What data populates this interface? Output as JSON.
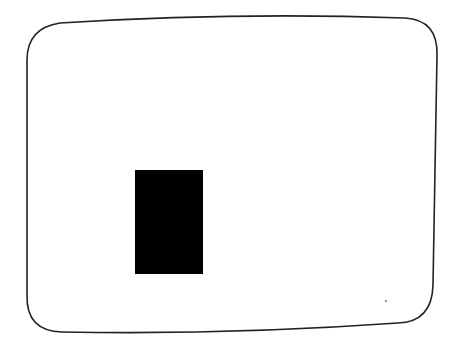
{
  "screen": {
    "background": "#ffffff",
    "frame_stroke": "#222222",
    "rect_fill": "#000000"
  }
}
